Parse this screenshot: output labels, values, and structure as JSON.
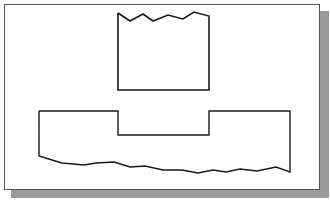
{
  "figure": {
    "frame": {
      "background": "#ffffff",
      "border": "#555555",
      "shadow": "#9a9a9a"
    },
    "stroke_color": "#1a1a1a",
    "shapes": [
      {
        "name": "upper-block",
        "points": "118,13 130,21 143,14 153,21 168,15 183,19 194,12 209,16 209,90 118,90 118,13"
      },
      {
        "name": "lower-slotted-block",
        "points": "39,111 118,111 118,135 209,135 209,111 290,111 290,172 276,167 257,171 240,169 226,172 213,170 198,173 182,170 163,170 145,166 130,167 114,162 96,163 84,165 62,163 52,160 39,156 39,111"
      }
    ]
  }
}
